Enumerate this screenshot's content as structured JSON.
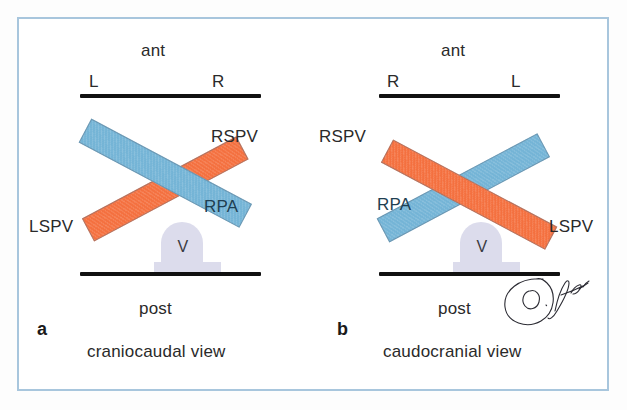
{
  "figure": {
    "title_none": "",
    "border_color": "#a8c6dd",
    "background_color": "#ffffff",
    "artery_color": "#f4703f",
    "vein_color": "#74b4d6",
    "vertebra_color": "#dcdcec",
    "line_color": "#111111"
  },
  "panels": [
    {
      "key": "a",
      "letter": "a",
      "caption": "craniocaudal view",
      "top_orientation": "ant",
      "bottom_orientation": "post",
      "left_side": "L",
      "right_side": "R",
      "vertebra_label": "V",
      "bars": [
        {
          "name": "blue-bar-rpa",
          "label": "RPA",
          "color_role": "vein_color"
        },
        {
          "name": "orange-bar-pv",
          "label_left": "LSPV",
          "label_right": "RSPV",
          "color_role": "artery_color"
        }
      ],
      "labels": {
        "rpa": "RPA",
        "rspv": "RSPV",
        "lspv": "LSPV"
      }
    },
    {
      "key": "b",
      "letter": "b",
      "caption": "caudocranial view",
      "top_orientation": "ant",
      "bottom_orientation": "post",
      "left_side": "R",
      "right_side": "L",
      "vertebra_label": "V",
      "bars": [
        {
          "name": "blue-bar-rpa",
          "label": "RPA",
          "color_role": "vein_color"
        },
        {
          "name": "orange-bar-pv",
          "label_left": "RSPV",
          "label_right": "LSPV",
          "color_role": "artery_color"
        }
      ],
      "labels": {
        "rpa": "RPA",
        "rspv": "RSPV",
        "lspv": "LSPV"
      }
    }
  ],
  "signature": {
    "name": "O. Jgauss",
    "alt": "handwritten artist signature"
  }
}
